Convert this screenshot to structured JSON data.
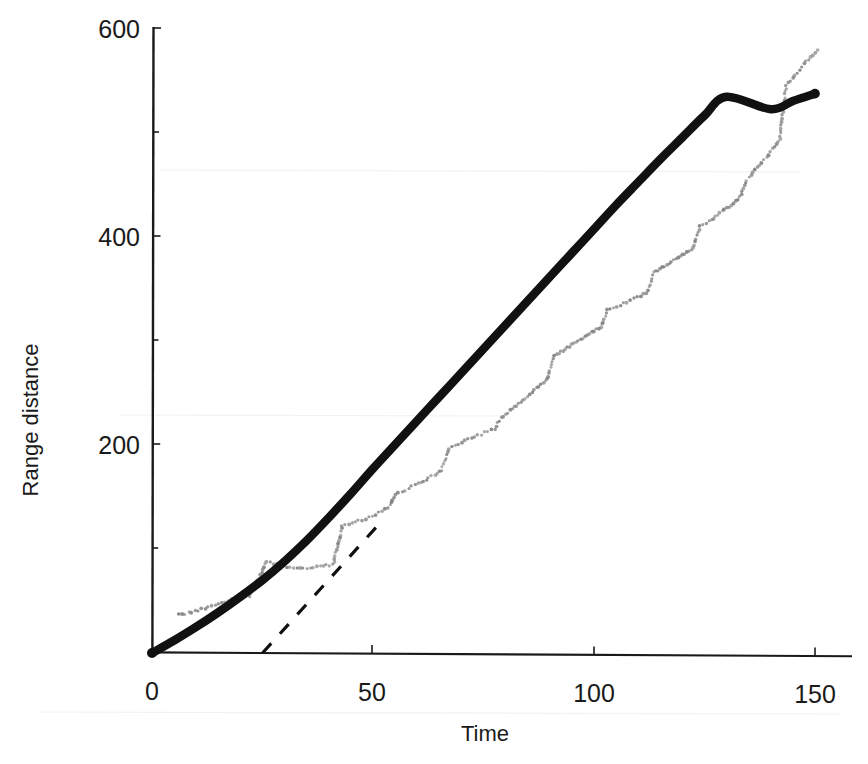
{
  "figure": {
    "background_color": "#ffffff",
    "ink_color": "#1a1a1a",
    "data_marker_color": "#808080"
  },
  "axes": {
    "x_title": "Time",
    "y_title": "Range distance",
    "x_ticks": [
      "0",
      "50",
      "100",
      "150"
    ],
    "y_ticks": [
      "200",
      "400",
      "600"
    ]
  },
  "chart_data": {
    "type": "scatter",
    "title": "",
    "subtitle": "",
    "xlabel": "Time",
    "ylabel": "Range distance",
    "xlim": [
      0,
      152
    ],
    "ylim": [
      0,
      620
    ],
    "xticks": [
      0,
      50,
      100,
      150
    ],
    "yticks": [
      200,
      400,
      600
    ],
    "grid": false,
    "legend": null,
    "legend_position": "none",
    "annotations": [],
    "series": [
      {
        "name": "Measured range (data points)",
        "style": "dotted-marker-trace",
        "marker": "small-filled-circle",
        "color": "#808080",
        "points": [
          [
            6,
            37
          ],
          [
            7.5,
            38
          ],
          [
            9,
            39
          ],
          [
            10.5,
            41
          ],
          [
            12,
            43
          ],
          [
            13.5,
            45
          ],
          [
            15,
            47
          ],
          [
            16.5,
            49
          ],
          [
            18,
            51
          ],
          [
            19.5,
            52
          ],
          [
            21,
            53
          ],
          [
            22,
            54
          ],
          [
            26,
            88
          ],
          [
            27.5,
            86
          ],
          [
            29,
            84
          ],
          [
            30.5,
            83
          ],
          [
            32,
            82
          ],
          [
            33.5,
            81
          ],
          [
            35,
            81
          ],
          [
            36.5,
            82
          ],
          [
            38,
            83
          ],
          [
            39.5,
            84
          ],
          [
            41,
            85
          ],
          [
            43,
            122
          ],
          [
            44.5,
            124
          ],
          [
            46,
            126
          ],
          [
            47.5,
            128
          ],
          [
            49,
            130
          ],
          [
            50.5,
            133
          ],
          [
            52,
            136
          ],
          [
            53.5,
            139
          ],
          [
            55,
            152
          ],
          [
            56.5,
            155
          ],
          [
            58,
            158
          ],
          [
            59.5,
            161
          ],
          [
            61,
            164
          ],
          [
            62.5,
            168
          ],
          [
            64,
            171
          ],
          [
            65.5,
            175
          ],
          [
            67,
            196
          ],
          [
            68.5,
            199
          ],
          [
            70,
            202
          ],
          [
            71.5,
            205
          ],
          [
            73,
            208
          ],
          [
            74.5,
            210
          ],
          [
            76,
            213
          ],
          [
            77.5,
            215
          ],
          [
            79,
            226
          ],
          [
            80.5,
            231
          ],
          [
            82,
            236
          ],
          [
            83.5,
            241
          ],
          [
            85,
            246
          ],
          [
            86.5,
            252
          ],
          [
            88,
            258
          ],
          [
            89.5,
            263
          ],
          [
            91,
            285
          ],
          [
            92.5,
            289
          ],
          [
            94,
            293
          ],
          [
            95.5,
            297
          ],
          [
            97,
            301
          ],
          [
            98.5,
            305
          ],
          [
            100,
            309
          ],
          [
            101.5,
            313
          ],
          [
            103,
            329
          ],
          [
            104.5,
            331
          ],
          [
            106,
            334
          ],
          [
            107.5,
            337
          ],
          [
            109,
            340
          ],
          [
            110.5,
            343
          ],
          [
            112,
            346
          ],
          [
            113.5,
            365
          ],
          [
            115,
            369
          ],
          [
            116.5,
            373
          ],
          [
            118,
            377
          ],
          [
            119.5,
            381
          ],
          [
            121,
            385
          ],
          [
            122.5,
            389
          ],
          [
            124,
            410
          ],
          [
            125.5,
            413
          ],
          [
            127,
            417
          ],
          [
            128.5,
            422
          ],
          [
            130,
            427
          ],
          [
            131.5,
            432
          ],
          [
            133,
            438
          ],
          [
            134.5,
            454
          ],
          [
            136,
            461
          ],
          [
            137.5,
            468
          ],
          [
            139,
            476
          ],
          [
            140.5,
            484
          ],
          [
            142,
            493
          ],
          [
            143.5,
            545
          ],
          [
            145,
            552
          ],
          [
            146.5,
            560
          ],
          [
            148,
            568
          ],
          [
            149.5,
            574
          ],
          [
            150.5,
            578
          ]
        ]
      },
      {
        "name": "Fitted range model (solid curve)",
        "style": "thick-solid-line",
        "color": "#111111",
        "points": [
          [
            0,
            0
          ],
          [
            5,
            12
          ],
          [
            10,
            25
          ],
          [
            15,
            39
          ],
          [
            20,
            54
          ],
          [
            25,
            70
          ],
          [
            30,
            88
          ],
          [
            35,
            108
          ],
          [
            40,
            130
          ],
          [
            45,
            153
          ],
          [
            50,
            177
          ],
          [
            55,
            200
          ],
          [
            60,
            223
          ],
          [
            65,
            246
          ],
          [
            70,
            269
          ],
          [
            75,
            292
          ],
          [
            80,
            315
          ],
          [
            85,
            338
          ],
          [
            90,
            361
          ],
          [
            95,
            384
          ],
          [
            100,
            407
          ],
          [
            105,
            430
          ],
          [
            110,
            452
          ],
          [
            115,
            474
          ],
          [
            120,
            495
          ],
          [
            125,
            516
          ],
          [
            130,
            534
          ],
          [
            135,
            519
          ],
          [
            140,
            522
          ],
          [
            145,
            530
          ],
          [
            150,
            537
          ]
        ]
      },
      {
        "name": "Linear asymptote (dashed line)",
        "style": "dashed-line",
        "color": "#111111",
        "points": [
          [
            25,
            0
          ],
          [
            51,
            122
          ]
        ]
      }
    ]
  }
}
